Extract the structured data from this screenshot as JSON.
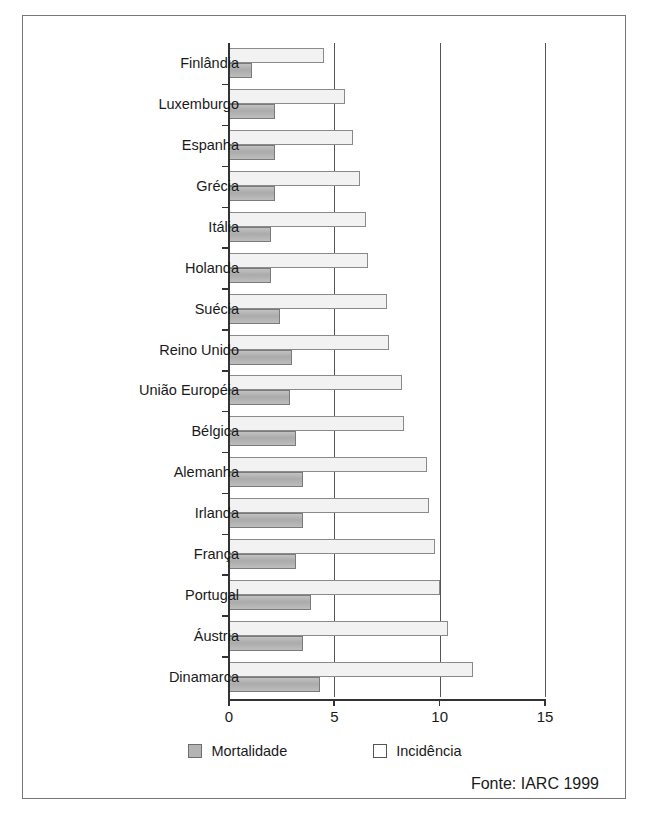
{
  "chart_data": {
    "type": "bar",
    "orientation": "horizontal",
    "title": "",
    "xlabel": "",
    "ylabel": "",
    "xlim": [
      0,
      15
    ],
    "xticks": [
      0,
      5,
      10,
      15
    ],
    "xtick_labels": [
      "0",
      "5",
      "10",
      "15"
    ],
    "grid": true,
    "grid_axis": "x",
    "legend_position": "bottom-center",
    "categories": [
      "Finlândia",
      "Luxemburgo",
      "Espanha",
      "Grécia",
      "Itália",
      "Holanda",
      "Suécia",
      "Reino Unido",
      "União Européia",
      "Bélgica",
      "Alemanha",
      "Irlanda",
      "França",
      "Portugal",
      "Áustria",
      "Dinamarca"
    ],
    "series": [
      {
        "name": "Incidência",
        "color": "#f2f2f2",
        "values": [
          4.5,
          5.5,
          5.9,
          6.2,
          6.5,
          6.6,
          7.5,
          7.6,
          8.2,
          8.3,
          9.4,
          9.5,
          9.8,
          10.0,
          10.4,
          11.6
        ]
      },
      {
        "name": "Mortalidade",
        "color": "#b4b4b4",
        "values": [
          1.1,
          2.2,
          2.2,
          2.2,
          2.0,
          2.0,
          2.4,
          3.0,
          2.9,
          3.2,
          3.5,
          3.5,
          3.2,
          3.9,
          3.5,
          4.3
        ]
      }
    ],
    "annotations": [
      "Fonte: IARC 1999"
    ]
  },
  "legend": {
    "items": [
      {
        "label": "Mortalidade",
        "swatch": "mortality-swatch"
      },
      {
        "label": "Incidência",
        "swatch": "incidence-swatch"
      }
    ]
  },
  "source": {
    "text": "Fonte: IARC 1999"
  }
}
